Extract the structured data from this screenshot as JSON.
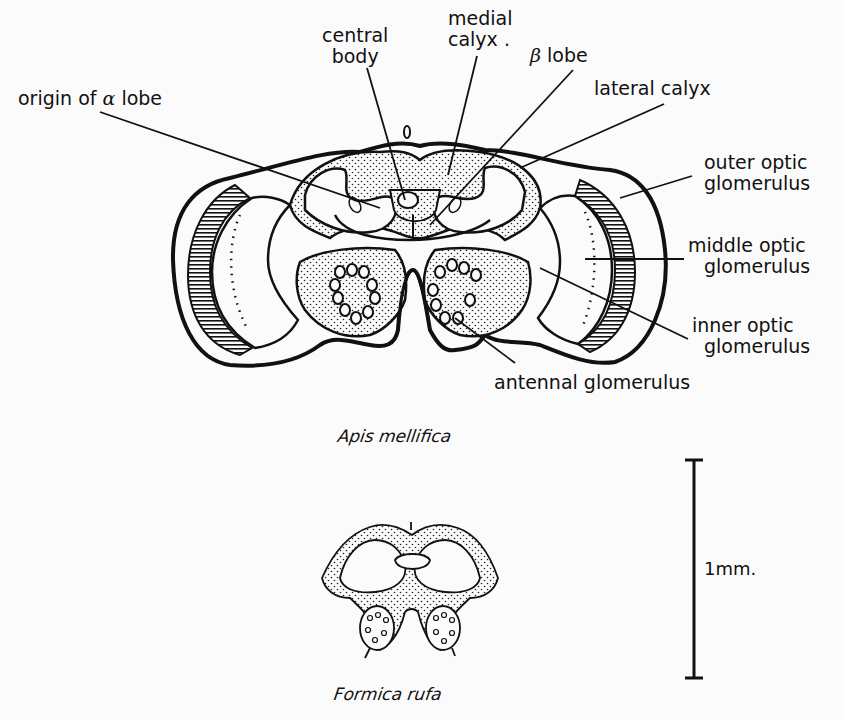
{
  "figure": {
    "labels": {
      "central_body": "central\nbody",
      "central_body_l1": "central",
      "central_body_l2": "body",
      "medial_calyx_l1": "medial",
      "medial_calyx_l2": "calyx .",
      "beta_lobe_symbol": "β",
      "beta_lobe_text": "lobe",
      "origin_alpha_prefix": "origin of",
      "origin_alpha_symbol": "α",
      "origin_alpha_suffix": "lobe",
      "lateral_calyx": "lateral calyx",
      "outer_optic_l1": "outer optic",
      "outer_optic_l2": "glomerulus",
      "middle_optic_l1": "middle optic",
      "middle_optic_l2": "glomerulus",
      "inner_optic_l1": "inner optic",
      "inner_optic_l2": "glomerulus",
      "antennal_glomerulus": "antennal glomerulus"
    },
    "species": {
      "upper": "Apis mellifica",
      "lower": "Formica rufa"
    },
    "scale_bar": {
      "label": "1mm."
    }
  }
}
